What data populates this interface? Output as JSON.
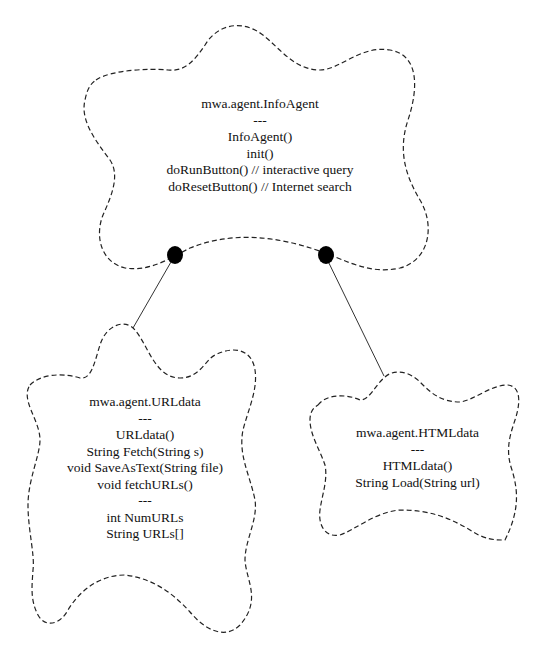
{
  "diagram": {
    "type": "class-collaboration",
    "colors": {
      "outline": "#222222",
      "connector": "#333333",
      "bullet": "#000000",
      "background": "#ffffff"
    },
    "classes": [
      {
        "id": "infoagent",
        "name": "mwa.agent.InfoAgent",
        "separator1": "---",
        "methods": [
          "InfoAgent()",
          "init()",
          "doRunButton() // interactive query",
          "doResetButton() // Internet search"
        ]
      },
      {
        "id": "urldata",
        "name": "mwa.agent.URLdata",
        "separator1": "---",
        "methods": [
          "URLdata()",
          "String Fetch(String s)",
          "void SaveAsText(String file)",
          "void fetchURLs()"
        ],
        "separator2": "---",
        "attributes": [
          "int NumURLs",
          "String URLs[]"
        ]
      },
      {
        "id": "htmldata",
        "name": "mwa.agent.HTMLdata",
        "separator1": "---",
        "methods": [
          "HTMLdata()",
          "String Load(String url)"
        ]
      }
    ],
    "relationships": [
      {
        "from": "mwa.agent.InfoAgent",
        "to": "mwa.agent.URLdata",
        "style": "has-by-value"
      },
      {
        "from": "mwa.agent.InfoAgent",
        "to": "mwa.agent.HTMLdata",
        "style": "has-by-value"
      }
    ]
  }
}
